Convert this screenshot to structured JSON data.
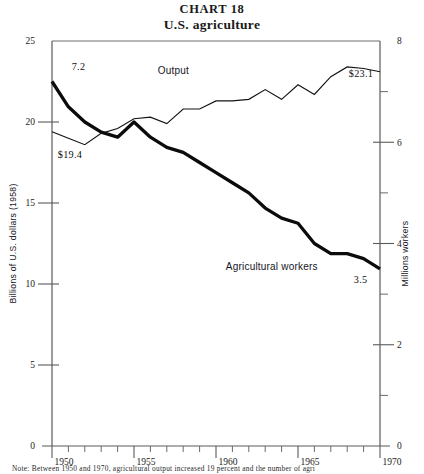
{
  "header": {
    "chart_number_label": "CHART  18",
    "chart_title": "U.S.  agriculture"
  },
  "footer": {
    "note": "Note: Between 1950 and 1970, agricultural output increased 19 percent and the number of agri"
  },
  "axes": {
    "left": {
      "title": "Billions of U.S. dollars (1958)",
      "ticks": [
        "0",
        "5",
        "10",
        "15",
        "20",
        "25"
      ],
      "min": 0,
      "max": 25
    },
    "right": {
      "title": "Millions workers",
      "ticks": [
        "0",
        "2",
        "4",
        "6",
        "8"
      ],
      "min": 0,
      "max": 8
    },
    "bottom": {
      "ticks": [
        "1950",
        "1955",
        "1960",
        "1965",
        "1970"
      ],
      "min": 1950,
      "max": 1970
    }
  },
  "annotations": {
    "output_series_label": "Output",
    "workers_series_label": "Agricultural workers",
    "output_start_value": "$19.4",
    "output_end_value": "$23.1",
    "workers_start_value": "7.2",
    "workers_end_value": "3.5"
  },
  "chart_data": {
    "type": "line",
    "title": "U.S. agriculture",
    "subtitle": "CHART 18",
    "xlabel": "",
    "ylabel": "Billions of U.S. dollars (1958)",
    "y2label": "Millions workers",
    "xlim": [
      1950,
      1970
    ],
    "ylim": [
      0,
      25
    ],
    "y2lim": [
      0,
      8
    ],
    "grid": false,
    "legend": "inline-labels",
    "x": [
      1950,
      1951,
      1952,
      1953,
      1954,
      1955,
      1956,
      1957,
      1958,
      1959,
      1960,
      1961,
      1962,
      1963,
      1964,
      1965,
      1966,
      1967,
      1968,
      1969,
      1970
    ],
    "series": [
      {
        "name": "Output",
        "axis": "left",
        "units": "billions of 1958 U.S. dollars",
        "start_label": "$19.4",
        "end_label": "$23.1",
        "values": [
          19.4,
          19.0,
          18.6,
          19.3,
          19.6,
          20.2,
          20.3,
          19.9,
          20.8,
          20.8,
          21.3,
          21.3,
          21.4,
          22.0,
          21.4,
          22.3,
          21.7,
          22.8,
          23.4,
          23.3,
          23.1
        ]
      },
      {
        "name": "Agricultural workers",
        "axis": "right",
        "units": "millions of workers",
        "start_label": "7.2",
        "end_label": "3.5",
        "values": [
          7.2,
          6.7,
          6.4,
          6.2,
          6.1,
          6.4,
          6.1,
          5.9,
          5.8,
          5.6,
          5.4,
          5.2,
          5.0,
          4.7,
          4.5,
          4.4,
          4.0,
          3.8,
          3.8,
          3.7,
          3.5
        ]
      }
    ]
  },
  "geometry": {
    "plot_left": 52,
    "plot_right": 380,
    "plot_top": 41,
    "plot_bottom": 446
  }
}
